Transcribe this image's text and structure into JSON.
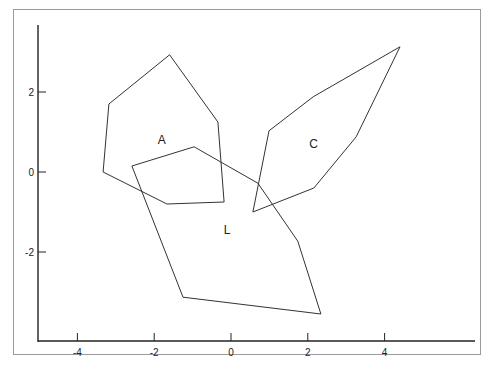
{
  "chart_data": {
    "type": "scatter",
    "subtype": "polygon-hull",
    "title": "",
    "xlabel": "",
    "ylabel": "",
    "xlim": [
      -5,
      6
    ],
    "ylim": [
      -4.2,
      3.7
    ],
    "grid": false,
    "legend": "none",
    "x_ticks": [
      -4,
      -2,
      0,
      2,
      4
    ],
    "y_ticks": [
      -2,
      0,
      2
    ],
    "x_tick_labels": [
      "-4",
      "-2",
      "0",
      "2",
      "4"
    ],
    "y_tick_labels": [
      "-2",
      "0",
      "2"
    ],
    "series": [
      {
        "name": "A",
        "label_pos": [
          -1.8,
          0.7
        ],
        "points": [
          [
            -1.6,
            2.93
          ],
          [
            -0.34,
            1.25
          ],
          [
            -0.18,
            -0.75
          ],
          [
            -1.67,
            -0.8
          ],
          [
            -3.33,
            0.0
          ],
          [
            -3.18,
            1.7
          ]
        ]
      },
      {
        "name": "L",
        "label_pos": [
          -0.1,
          -1.55
        ],
        "points": [
          [
            -2.58,
            0.15
          ],
          [
            -0.96,
            0.63
          ],
          [
            0.7,
            -0.28
          ],
          [
            1.74,
            -1.73
          ],
          [
            2.34,
            -3.55
          ],
          [
            -1.25,
            -3.13
          ]
        ]
      },
      {
        "name": "C",
        "label_pos": [
          2.15,
          0.6
        ],
        "points": [
          [
            4.4,
            3.13
          ],
          [
            3.26,
            0.88
          ],
          [
            2.16,
            -0.4
          ],
          [
            0.57,
            -1.0
          ],
          [
            0.99,
            1.03
          ],
          [
            2.14,
            1.88
          ]
        ]
      }
    ]
  },
  "labels": {
    "A": "A",
    "L": "L",
    "C": "C",
    "x_ticks": [
      "-4",
      "-2",
      "0",
      "2",
      "4"
    ],
    "y_ticks": [
      "-2",
      "0",
      "2"
    ]
  }
}
